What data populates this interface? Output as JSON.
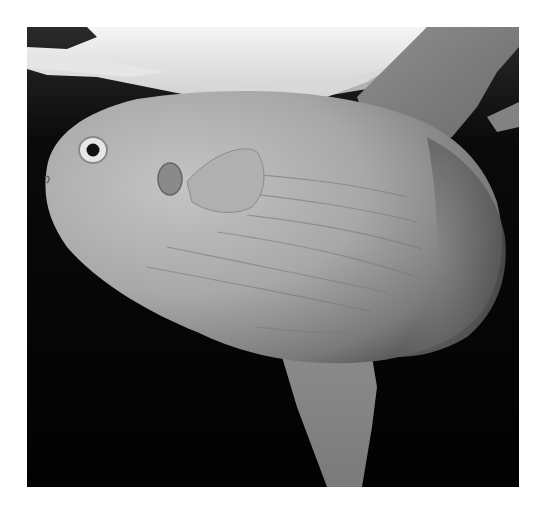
{
  "image": {
    "subject": "Ocean sunfish (Mola mola) swimming just beneath the water surface",
    "alt_text": "Black-and-white underwater photograph of an ocean sunfish with its eye, small pectoral fin, tall dorsal fin and lower anal fin visible against a dark background",
    "style": "grayscale photograph",
    "colors": {
      "page_background": "#ffffff",
      "water_background": "#030303",
      "surface_highlight": "#eeeeee",
      "body_light": "#bdbdbd",
      "body_mid": "#9a9a9a",
      "body_shadow": "#5a5a5a",
      "eye_pupil": "#111111"
    }
  }
}
